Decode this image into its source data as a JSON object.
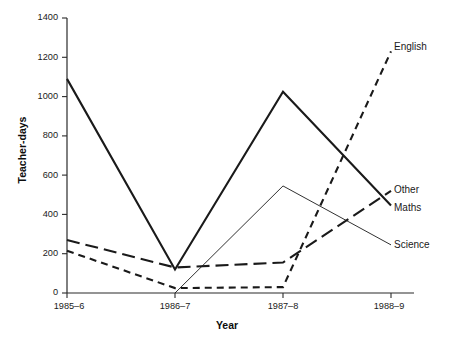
{
  "chart_data": {
    "type": "line",
    "title": "",
    "xlabel": "Year",
    "ylabel": "Teacher-days",
    "categories": [
      "1985–6",
      "1986–7",
      "1987–8",
      "1988–9"
    ],
    "ylim": [
      0,
      1400
    ],
    "yticks": [
      0,
      200,
      400,
      600,
      800,
      1000,
      1200,
      1400
    ],
    "ytick_labels": [
      "0",
      "200",
      "400",
      "600",
      "800",
      "1000",
      "1200",
      "1400"
    ],
    "grid": false,
    "legend_position": "right-of-plot-end-labels",
    "series": [
      {
        "name": "Maths",
        "label": "Maths",
        "style": "solid-thick",
        "color": "#1a1a1a",
        "values": [
          1090,
          120,
          1025,
          445
        ]
      },
      {
        "name": "Other",
        "label": "Other",
        "style": "long-dash",
        "color": "#1a1a1a",
        "values": [
          270,
          130,
          155,
          520
        ]
      },
      {
        "name": "English",
        "label": "English",
        "style": "short-dash",
        "color": "#1a1a1a",
        "values": [
          215,
          25,
          30,
          1230
        ]
      },
      {
        "name": "Science",
        "label": "Science",
        "style": "solid-thin",
        "color": "#1a1a1a",
        "values": [
          null,
          0,
          545,
          245
        ]
      }
    ]
  },
  "axes": {
    "y_title": "Teacher-days",
    "x_title": "Year"
  },
  "labels": {
    "english": "English",
    "other": "Other",
    "maths": "Maths",
    "science": "Science",
    "y1400": "1400",
    "y1200": "1200",
    "y1000": "1000",
    "y800": "800",
    "y600": "600",
    "y400": "400",
    "y200": "200",
    "y0": "0",
    "x1": "1985–6",
    "x2": "1986–7",
    "x3": "1987–8",
    "x4": "1988–9"
  }
}
